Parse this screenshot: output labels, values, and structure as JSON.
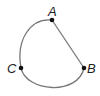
{
  "diagram": {
    "type": "circular-arc-with-chord",
    "points": [
      {
        "label": "A",
        "x": 52,
        "y": 20
      },
      {
        "label": "B",
        "x": 84,
        "y": 68
      },
      {
        "label": "C",
        "x": 21,
        "y": 68
      }
    ],
    "segments": [
      {
        "from": "A",
        "to": "B"
      }
    ],
    "arcs": [
      {
        "from": "A",
        "through": "C",
        "to": "B"
      }
    ],
    "colors": {
      "line": "#777777",
      "point": "#111111",
      "label": "#222222"
    }
  }
}
